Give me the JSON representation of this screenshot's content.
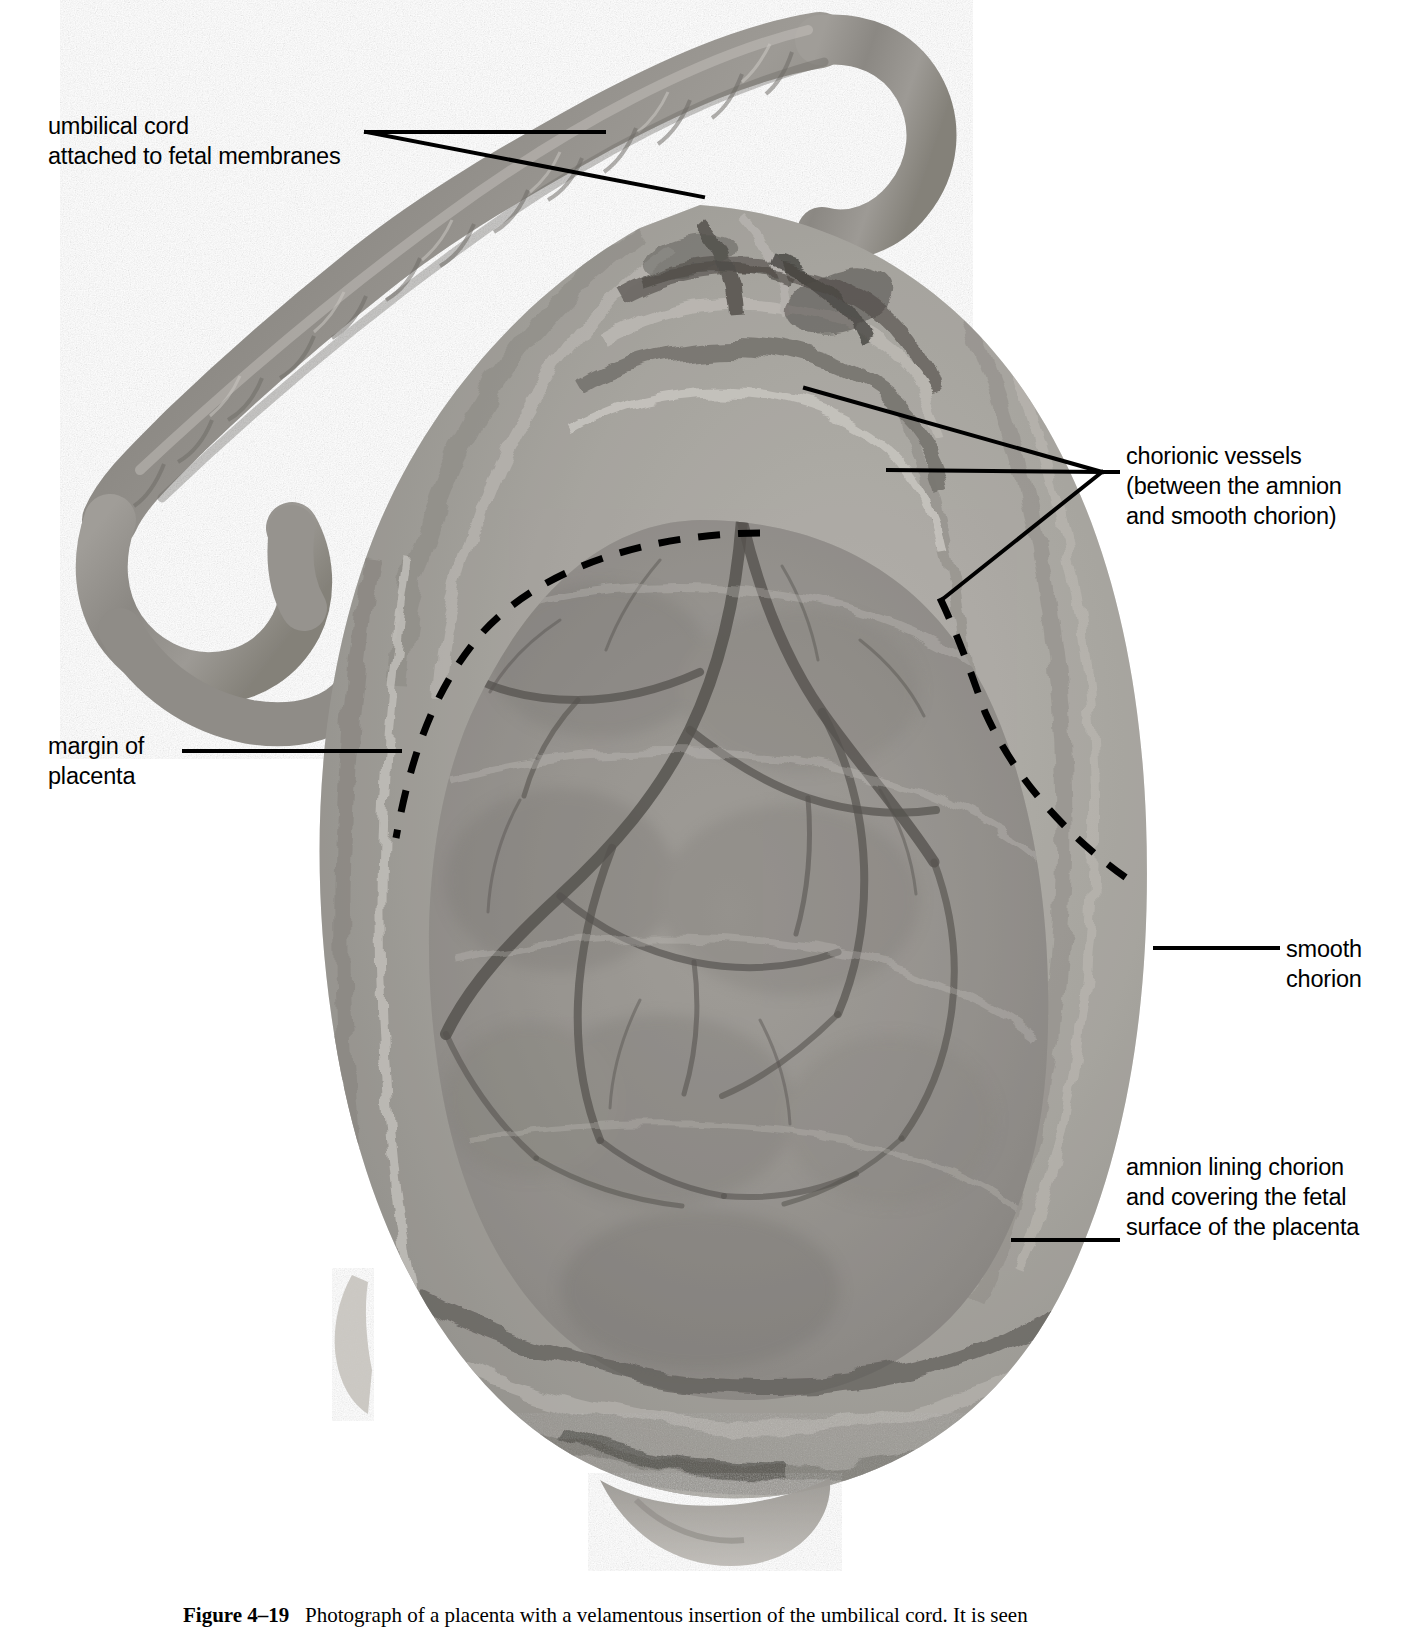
{
  "figure": {
    "domain": "anatomy-photograph",
    "kind": "labelled gross-anatomy photograph",
    "background_color": "#ffffff",
    "ink_color": "#000000"
  },
  "labels": [
    {
      "id": "umbilical-cord",
      "name": "umbilical-cord-label",
      "align": "left",
      "x": 48,
      "y": 111,
      "lines": [
        "umbilical cord",
        "attached to fetal membranes"
      ]
    },
    {
      "id": "chorionic-vessels",
      "name": "chorionic-vessels-label",
      "align": "right",
      "x": 1126,
      "y": 441,
      "lines": [
        "chorionic vessels",
        "(between the amnion",
        "and smooth chorion)"
      ]
    },
    {
      "id": "margin-of-placenta",
      "name": "margin-of-placenta-label",
      "align": "left",
      "x": 48,
      "y": 731,
      "lines": [
        "margin of",
        "placenta"
      ]
    },
    {
      "id": "smooth-chorion",
      "name": "smooth-chorion-label",
      "align": "right",
      "x": 1286,
      "y": 934,
      "lines": [
        "smooth",
        "chorion"
      ]
    },
    {
      "id": "amnion-lining-chorion",
      "name": "amnion-lining-chorion-label",
      "align": "right",
      "x": 1126,
      "y": 1152,
      "lines": [
        "amnion lining chorion",
        "and covering the fetal",
        "surface of the placenta"
      ]
    }
  ],
  "leaders": [
    {
      "id": "leader-umbilical-cord-1",
      "points": "366,132 604,132"
    },
    {
      "id": "leader-umbilical-cord-2",
      "points": "366,132 703,197"
    },
    {
      "id": "leader-chorionic-vessels-1",
      "points": "1102,472 805,388"
    },
    {
      "id": "leader-chorionic-vessels-2",
      "points": "1102,472 888,470"
    },
    {
      "id": "leader-chorionic-vessels-3",
      "points": "1102,472 944,598"
    },
    {
      "id": "leader-chorionic-vessels-tail",
      "points": "1102,472 1118,472"
    },
    {
      "id": "leader-margin-of-placenta",
      "points": "184,751 400,751"
    },
    {
      "id": "leader-smooth-chorion",
      "points": "1155,948 1278,948"
    },
    {
      "id": "leader-amnion",
      "points": "1013,1240 1118,1240"
    }
  ],
  "margin_dashes": {
    "id": "placental-margin-dashed-line",
    "description": "dashed curve outlining the margin of the placenta on the fetal surface",
    "path": "M 760,533 C 640,534 532,572 476,640 C 432,694 410,760 396,838"
  },
  "margin_dashes_right": {
    "id": "placental-margin-dashed-line-right",
    "description": "dashed curve continuing down the right side of the placental margin",
    "path": "M 940,598 C 960,640 972,676 985,712 C 1020,790 1080,846 1132,882"
  },
  "caption": {
    "id": "figure-caption",
    "figure_number": "Figure 4–19",
    "text": "Photograph of a placenta with a velamentous insertion of the umbilical cord. It is seen",
    "clipped": true
  }
}
